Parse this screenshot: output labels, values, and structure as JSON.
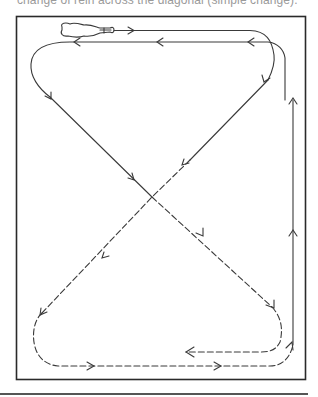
{
  "caption": "change of rein across the diagonal (simple change).",
  "diagram": {
    "title": "Change of rein across the diagonal",
    "arena": {
      "x": 16,
      "y": 16,
      "width": 290,
      "height": 364
    },
    "legend": {
      "solid_line": "track before change of rein",
      "dashed_line": "track after change of rein"
    },
    "icons": [
      "horse-icon"
    ],
    "colors": {
      "line": "#3a3a3a",
      "border": "#2a2a2a",
      "caption": "#9a9a9a"
    }
  }
}
